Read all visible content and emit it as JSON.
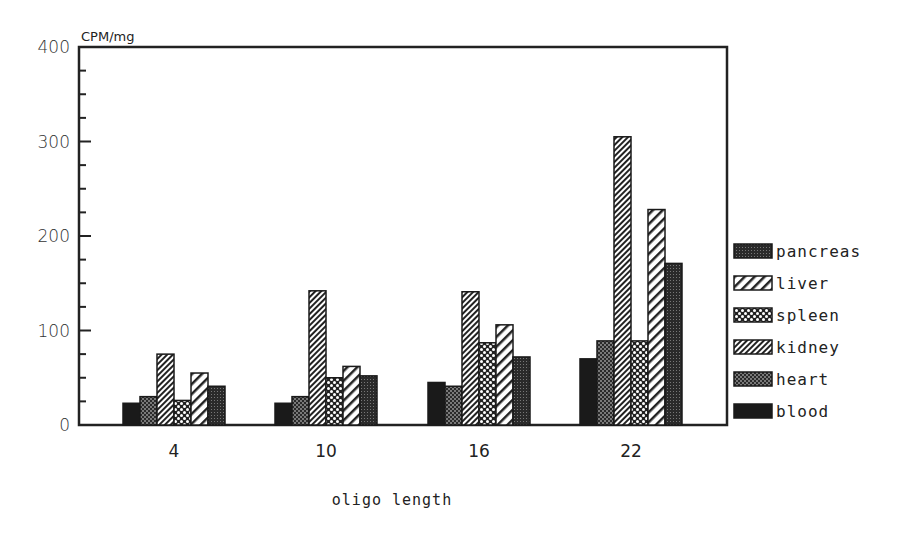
{
  "chart_data": {
    "type": "bar",
    "title": "",
    "ylabel": "CPM/mg",
    "xlabel": "oligo length",
    "ylim": [
      0,
      400
    ],
    "yticks": [
      0,
      100,
      200,
      300,
      400
    ],
    "ytick_labels": [
      "0",
      "100",
      "200",
      "300",
      "400"
    ],
    "minor_tick_step": 25,
    "grid": false,
    "legend_position": "right, outside",
    "categories": [
      "4",
      "10",
      "16",
      "22"
    ],
    "bar_order": [
      "blood",
      "heart",
      "kidney",
      "spleen",
      "liver",
      "pancreas"
    ],
    "series": [
      {
        "name": "pancreas",
        "pattern": "grid",
        "values": [
          41,
          52,
          72,
          171
        ]
      },
      {
        "name": "liver",
        "pattern": "wide-diagonal",
        "values": [
          55,
          62,
          106,
          228
        ]
      },
      {
        "name": "spleen",
        "pattern": "cross-dots",
        "values": [
          26,
          50,
          87,
          89
        ]
      },
      {
        "name": "kidney",
        "pattern": "dense-diagonal",
        "values": [
          75,
          142,
          141,
          305
        ]
      },
      {
        "name": "heart",
        "pattern": "fine-dots",
        "values": [
          30,
          30,
          41,
          89
        ]
      },
      {
        "name": "blood",
        "pattern": "solid",
        "values": [
          23,
          23,
          45,
          70
        ]
      }
    ]
  },
  "labels": {
    "y_unit": "CPM/mg",
    "x_title": "oligo length"
  },
  "legend": {
    "items": [
      "pancreas",
      "liver",
      "spleen",
      "kidney",
      "heart",
      "blood"
    ]
  }
}
